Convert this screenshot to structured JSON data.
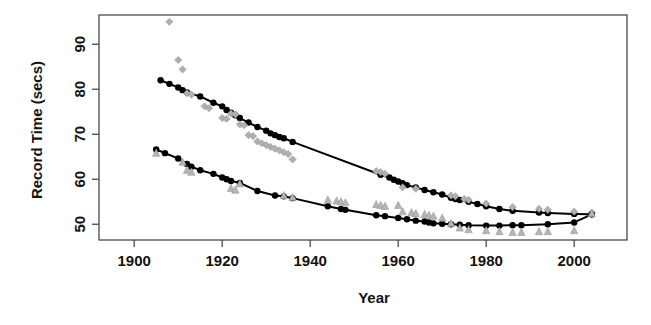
{
  "figure": {
    "title": "",
    "background": "#ffffff",
    "ink_color": "#111111"
  },
  "axes": {
    "x": {
      "label": "Year",
      "ticks": [
        1900,
        1920,
        1940,
        1960,
        1980,
        2000
      ],
      "tick_labels": [
        "1900",
        "1920",
        "1940",
        "1960",
        "1980",
        "2000"
      ],
      "range": [
        1892,
        2012
      ]
    },
    "y": {
      "label": "Record Time (secs)",
      "ticks": [
        50,
        60,
        70,
        80,
        90
      ],
      "tick_labels": [
        "50",
        "60",
        "70",
        "80",
        "90"
      ],
      "range": [
        46.5,
        96.5
      ]
    }
  },
  "style": {
    "fit_line_color": "#000000",
    "fit_marker_color": "#000000",
    "raw_marker_color": "#b0b0b0",
    "axis_color": "#4a4a4a"
  },
  "chart_data": {
    "type": "scatter",
    "title": "",
    "xlabel": "Year",
    "ylabel": "Record Time (secs)",
    "xlim": [
      1892,
      2012
    ],
    "ylim": [
      46.5,
      96.5
    ],
    "grid": false,
    "legend": "none",
    "series": [
      {
        "name": "upper-series-fitted",
        "marker": "filled-circle",
        "color": "#000000",
        "line": true,
        "points": [
          [
            1906,
            82.0
          ],
          [
            1908,
            81.2
          ],
          [
            1910,
            80.4
          ],
          [
            1911,
            79.8
          ],
          [
            1912,
            79.3
          ],
          [
            1915,
            78.4
          ],
          [
            1918,
            77.0
          ],
          [
            1920,
            76.2
          ],
          [
            1921,
            75.4
          ],
          [
            1922,
            74.8
          ],
          [
            1923,
            74.2
          ],
          [
            1924,
            73.6
          ],
          [
            1926,
            72.6
          ],
          [
            1928,
            71.6
          ],
          [
            1930,
            70.8
          ],
          [
            1931,
            70.2
          ],
          [
            1932,
            69.8
          ],
          [
            1933,
            69.4
          ],
          [
            1934,
            69.1
          ],
          [
            1936,
            68.3
          ],
          [
            1956,
            61.0
          ],
          [
            1958,
            60.4
          ],
          [
            1959,
            59.9
          ],
          [
            1960,
            59.5
          ],
          [
            1961,
            59.1
          ],
          [
            1962,
            58.7
          ],
          [
            1964,
            58.2
          ],
          [
            1966,
            57.6
          ],
          [
            1968,
            57.1
          ],
          [
            1970,
            56.6
          ],
          [
            1972,
            55.9
          ],
          [
            1973,
            55.6
          ],
          [
            1974,
            55.4
          ],
          [
            1976,
            55.0
          ],
          [
            1978,
            54.5
          ],
          [
            1980,
            54.0
          ],
          [
            1983,
            53.4
          ],
          [
            1986,
            53.0
          ],
          [
            1992,
            52.6
          ],
          [
            1994,
            52.5
          ],
          [
            2000,
            52.3
          ],
          [
            2004,
            52.2
          ]
        ]
      },
      {
        "name": "upper-series-observed",
        "marker": "diamond",
        "color": "#b0b0b0",
        "line": false,
        "points": [
          [
            1908,
            95.0
          ],
          [
            1910,
            86.5
          ],
          [
            1911,
            84.4
          ],
          [
            1912,
            79.1
          ],
          [
            1913,
            78.8
          ],
          [
            1916,
            76.2
          ],
          [
            1917,
            75.8
          ],
          [
            1920,
            73.6
          ],
          [
            1921,
            73.4
          ],
          [
            1922,
            74.6
          ],
          [
            1923,
            74.4
          ],
          [
            1924,
            72.2
          ],
          [
            1925,
            72.0
          ],
          [
            1926,
            69.8
          ],
          [
            1927,
            69.6
          ],
          [
            1928,
            68.4
          ],
          [
            1929,
            68.0
          ],
          [
            1930,
            67.6
          ],
          [
            1931,
            67.2
          ],
          [
            1932,
            66.8
          ],
          [
            1933,
            66.4
          ],
          [
            1934,
            66.0
          ],
          [
            1935,
            65.6
          ],
          [
            1936,
            64.4
          ],
          [
            1955,
            61.8
          ],
          [
            1956,
            61.6
          ],
          [
            1957,
            61.2
          ],
          [
            1961,
            58.2
          ],
          [
            1964,
            57.9
          ],
          [
            1972,
            56.4
          ],
          [
            1973,
            56.2
          ],
          [
            1975,
            55.6
          ],
          [
            1976,
            55.4
          ],
          [
            1980,
            54.6
          ],
          [
            1986,
            53.8
          ],
          [
            1992,
            53.4
          ],
          [
            1994,
            53.2
          ],
          [
            2000,
            52.8
          ],
          [
            2004,
            52.6
          ]
        ]
      },
      {
        "name": "lower-series-fitted",
        "marker": "filled-circle",
        "color": "#000000",
        "line": true,
        "points": [
          [
            1905,
            66.6
          ],
          [
            1907,
            65.8
          ],
          [
            1910,
            64.6
          ],
          [
            1912,
            63.4
          ],
          [
            1913,
            62.8
          ],
          [
            1915,
            62.0
          ],
          [
            1918,
            61.2
          ],
          [
            1920,
            60.4
          ],
          [
            1921,
            60.0
          ],
          [
            1922,
            59.6
          ],
          [
            1924,
            59.2
          ],
          [
            1928,
            57.4
          ],
          [
            1932,
            56.4
          ],
          [
            1934,
            56.2
          ],
          [
            1936,
            55.8
          ],
          [
            1944,
            54.0
          ],
          [
            1947,
            53.4
          ],
          [
            1948,
            53.2
          ],
          [
            1955,
            52.0
          ],
          [
            1957,
            51.8
          ],
          [
            1960,
            51.4
          ],
          [
            1962,
            51.1
          ],
          [
            1964,
            50.8
          ],
          [
            1966,
            50.6
          ],
          [
            1967,
            50.4
          ],
          [
            1968,
            50.2
          ],
          [
            1970,
            50.1
          ],
          [
            1972,
            50.0
          ],
          [
            1974,
            49.9
          ],
          [
            1976,
            49.8
          ],
          [
            1980,
            49.7
          ],
          [
            1983,
            49.7
          ],
          [
            1986,
            49.8
          ],
          [
            1988,
            49.8
          ],
          [
            1994,
            50.0
          ],
          [
            2000,
            50.4
          ],
          [
            2004,
            52.2
          ]
        ]
      },
      {
        "name": "lower-series-observed",
        "marker": "triangle",
        "color": "#b4b4b4",
        "line": false,
        "points": [
          [
            1905,
            65.8
          ],
          [
            1911,
            63.8
          ],
          [
            1912,
            62.0
          ],
          [
            1913,
            61.6
          ],
          [
            1922,
            58.0
          ],
          [
            1923,
            57.6
          ],
          [
            1924,
            59.0
          ],
          [
            1934,
            56.4
          ],
          [
            1936,
            56.0
          ],
          [
            1944,
            55.4
          ],
          [
            1946,
            55.2
          ],
          [
            1947,
            55.0
          ],
          [
            1948,
            54.8
          ],
          [
            1955,
            54.4
          ],
          [
            1956,
            54.2
          ],
          [
            1957,
            54.0
          ],
          [
            1960,
            54.2
          ],
          [
            1961,
            52.8
          ],
          [
            1963,
            52.6
          ],
          [
            1964,
            52.4
          ],
          [
            1966,
            52.2
          ],
          [
            1967,
            52.0
          ],
          [
            1968,
            51.8
          ],
          [
            1970,
            51.4
          ],
          [
            1972,
            50.2
          ],
          [
            1974,
            49.2
          ],
          [
            1976,
            48.8
          ],
          [
            1980,
            48.6
          ],
          [
            1983,
            48.4
          ],
          [
            1986,
            48.2
          ],
          [
            1988,
            48.2
          ],
          [
            1992,
            48.4
          ],
          [
            1994,
            48.4
          ],
          [
            2000,
            48.6
          ],
          [
            2004,
            52.4
          ]
        ]
      }
    ]
  }
}
